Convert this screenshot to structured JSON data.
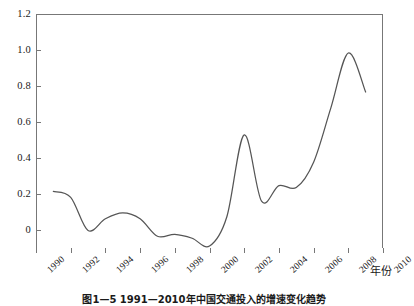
{
  "chart_data": {
    "type": "line",
    "title": "",
    "xlabel": "年份",
    "ylabel": "",
    "xlim": [
      1990,
      2010
    ],
    "ylim": [
      0,
      1.2
    ],
    "grid": false,
    "legend": false,
    "x_tick_labels": [
      "1990",
      "1992",
      "1994",
      "1996",
      "1998",
      "2000",
      "2002",
      "2004",
      "2006",
      "2008",
      "2010"
    ],
    "x_ticks": [
      1990,
      1992,
      1994,
      1996,
      1998,
      2000,
      2002,
      2004,
      2006,
      2008,
      2010
    ],
    "y_tick_labels": [
      "0",
      "0.2",
      "0.4",
      "0.6",
      "0.8",
      "1.0",
      "1.2"
    ],
    "y_ticks": [
      0,
      0.2,
      0.4,
      0.6,
      0.8,
      1.0,
      1.2
    ],
    "x": [
      1991,
      1992,
      1993,
      1994,
      1995,
      1996,
      1997,
      1998,
      1999,
      2000,
      2001,
      2002,
      2003,
      2004,
      2005,
      2006,
      2007,
      2008,
      2009
    ],
    "values": [
      0.29,
      0.26,
      0.09,
      0.15,
      0.18,
      0.15,
      0.06,
      0.07,
      0.05,
      0.01,
      0.16,
      0.58,
      0.24,
      0.32,
      0.31,
      0.44,
      0.72,
      1.0,
      0.8
    ],
    "series": [
      {
        "name": "",
        "color": "#555555",
        "values": [
          0.29,
          0.26,
          0.09,
          0.15,
          0.18,
          0.15,
          0.06,
          0.07,
          0.05,
          0.01,
          0.16,
          0.58,
          0.24,
          0.32,
          0.31,
          0.44,
          0.72,
          1.0,
          0.8
        ]
      }
    ],
    "annotations": []
  },
  "caption": {
    "text": "图1—5  1991—2010年中国交通投入的增速变化趋势"
  },
  "colors": {
    "line": "#555555",
    "axis": "#777777",
    "text": "#1a1a1a",
    "background": "#ffffff"
  }
}
